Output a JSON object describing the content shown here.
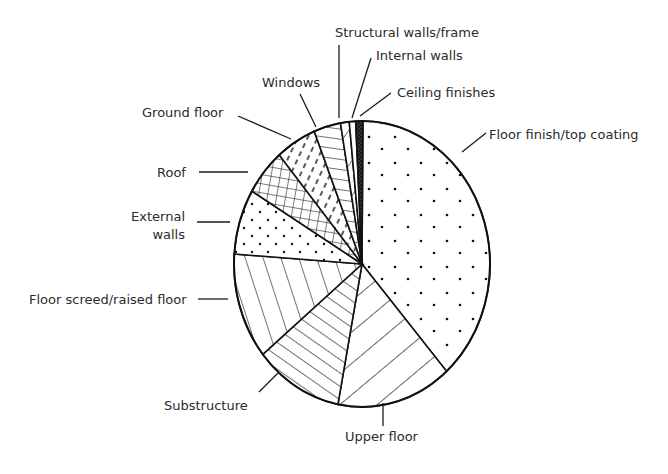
{
  "chart_data": {
    "type": "pie",
    "title": "",
    "start_angle_deg": 0.4,
    "direction": "clockwise",
    "categories": [
      "Floor finish/top coating",
      "Upper floor",
      "Substructure",
      "Floor screed/raised floor",
      "External walls",
      "Roof",
      "Ground floor",
      "Windows",
      "Structural walls/frame",
      "Internal walls",
      "Ceiling finishes"
    ],
    "values": [
      38.4,
      14.5,
      11.1,
      12.0,
      7.4,
      5.3,
      5.1,
      3.4,
      1.1,
      0.8,
      0.9
    ],
    "unit": "% (estimated from slice angles)",
    "patterns": [
      "sparse-dots",
      "wide-diagonal-up",
      "dense-diagonal-down",
      "near-vertical-lines",
      "dots",
      "crosshatch",
      "short-dashes",
      "horizontal-lines",
      "diagonal-single",
      "blank",
      "solid-dark"
    ],
    "legend": "none (leader-line labels)",
    "labels_layout": [
      {
        "text": "Floor finish/top coating",
        "x": 489,
        "y": 139,
        "anchor": "start",
        "line": [
          [
            486,
            133
          ],
          [
            462,
            152
          ]
        ]
      },
      {
        "text": "Upper floor",
        "x": 345,
        "y": 441,
        "anchor": "start",
        "line": [
          [
            383,
            426
          ],
          [
            383,
            403
          ]
        ]
      },
      {
        "text": "Substructure",
        "x": 164,
        "y": 410,
        "anchor": "start",
        "line": [
          [
            259,
            392
          ],
          [
            278,
            373
          ]
        ]
      },
      {
        "text": "Floor screed/raised floor",
        "x": 29,
        "y": 304,
        "anchor": "start",
        "line": [
          [
            198,
            299
          ],
          [
            228,
            299
          ]
        ]
      },
      {
        "text": "External walls",
        "x": 185,
        "y": 221,
        "anchor": "end",
        "line": [
          [
            197,
            222
          ],
          [
            230,
            222
          ]
        ],
        "multiline": [
          "External",
          "walls"
        ]
      },
      {
        "text": "Roof",
        "x": 157,
        "y": 177,
        "anchor": "start",
        "line": [
          [
            199,
            172
          ],
          [
            248,
            172
          ]
        ]
      },
      {
        "text": "Ground floor",
        "x": 142,
        "y": 117,
        "anchor": "start",
        "line": [
          [
            238,
            116
          ],
          [
            291,
            139
          ]
        ]
      },
      {
        "text": "Windows",
        "x": 262,
        "y": 87,
        "anchor": "start",
        "line": [
          [
            300,
            94
          ],
          [
            316,
            127
          ]
        ]
      },
      {
        "text": "Structural walls/frame",
        "x": 335,
        "y": 37,
        "anchor": "start",
        "line": [
          [
            339,
            45
          ],
          [
            339,
            118
          ]
        ]
      },
      {
        "text": "Internal walls",
        "x": 376,
        "y": 60,
        "anchor": "start",
        "line": [
          [
            371,
            58
          ],
          [
            352,
            118
          ]
        ]
      },
      {
        "text": "Ceiling finishes",
        "x": 397,
        "y": 97,
        "anchor": "start",
        "line": [
          [
            391,
            93
          ],
          [
            360,
            116
          ]
        ]
      }
    ],
    "geometry": {
      "cx": 362,
      "cy": 264,
      "rx": 128,
      "ry": 143
    }
  }
}
